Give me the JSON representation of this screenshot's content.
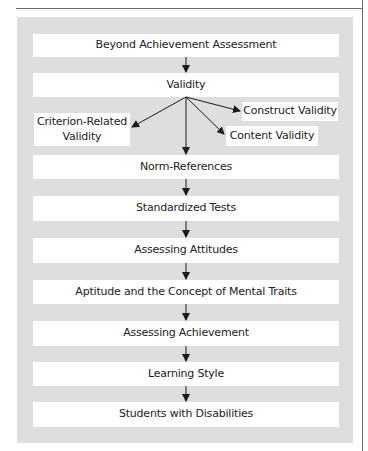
{
  "diagram": {
    "nodes": {
      "root": "Beyond Achievement Assessment",
      "validity": "Validity",
      "criterion_line1": "Criterion-Related",
      "criterion_line2": "Validity",
      "construct": "Construct Validity",
      "content": "Content Validity",
      "norm": "Norm-References",
      "standardized": "Standardized Tests",
      "attitudes": "Assessing Attitudes",
      "aptitude": "Aptitude and the Concept of Mental Traits",
      "achievement": "Assessing Achievement",
      "learning": "Learning Style",
      "disabilities": "Students with Disabilities"
    },
    "edges": [
      [
        "Beyond Achievement Assessment",
        "Validity"
      ],
      [
        "Validity",
        "Criterion-Related Validity"
      ],
      [
        "Validity",
        "Construct Validity"
      ],
      [
        "Validity",
        "Content Validity"
      ],
      [
        "Validity",
        "Norm-References"
      ],
      [
        "Norm-References",
        "Standardized Tests"
      ],
      [
        "Standardized Tests",
        "Assessing Attitudes"
      ],
      [
        "Assessing Attitudes",
        "Aptitude and the Concept of Mental Traits"
      ],
      [
        "Aptitude and the Concept of Mental Traits",
        "Assessing Achievement"
      ],
      [
        "Assessing Achievement",
        "Learning Style"
      ],
      [
        "Learning Style",
        "Students with Disabilities"
      ]
    ],
    "colors": {
      "panel": "#dedede",
      "box": "#ffffff",
      "arrow": "#1a1a1a",
      "rule": "#6a6a6a"
    }
  }
}
